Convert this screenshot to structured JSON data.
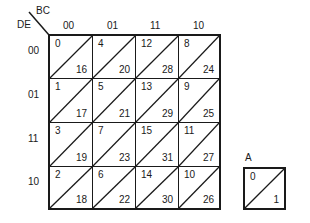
{
  "kmap": {
    "row_var": "DE",
    "col_var": "BC",
    "col_headers": [
      "00",
      "01",
      "11",
      "10"
    ],
    "row_headers": [
      "00",
      "01",
      "11",
      "10"
    ],
    "rows": [
      [
        {
          "top": "0",
          "bottom": "16"
        },
        {
          "top": "4",
          "bottom": "20"
        },
        {
          "top": "12",
          "bottom": "28"
        },
        {
          "top": "8",
          "bottom": "24"
        }
      ],
      [
        {
          "top": "1",
          "bottom": "17"
        },
        {
          "top": "5",
          "bottom": "21"
        },
        {
          "top": "13",
          "bottom": "29"
        },
        {
          "top": "9",
          "bottom": "25"
        }
      ],
      [
        {
          "top": "3",
          "bottom": "19"
        },
        {
          "top": "7",
          "bottom": "23"
        },
        {
          "top": "15",
          "bottom": "31"
        },
        {
          "top": "11",
          "bottom": "27"
        }
      ],
      [
        {
          "top": "2",
          "bottom": "18"
        },
        {
          "top": "6",
          "bottom": "22"
        },
        {
          "top": "14",
          "bottom": "30"
        },
        {
          "top": "10",
          "bottom": "26"
        }
      ]
    ]
  },
  "a_box": {
    "label": "A",
    "top": "0",
    "bottom": "1"
  }
}
